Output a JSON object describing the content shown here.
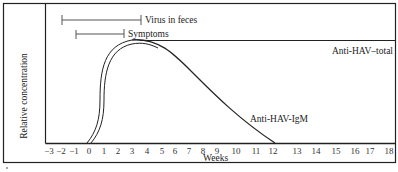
{
  "chart_data": {
    "type": "line",
    "title": "",
    "xlabel": "Weeks",
    "ylabel": "Relative concentration",
    "x_ticks": [
      "-3",
      "-2",
      "-1",
      "0",
      "1",
      "2",
      "3",
      "4",
      "5",
      "6",
      "7",
      "8",
      "9",
      "10",
      "11",
      "12",
      "13",
      "14",
      "15",
      "16",
      "17",
      "18"
    ],
    "xlim": [
      -3,
      18
    ],
    "grid": false,
    "legend": "none (inline labels)",
    "series": [
      {
        "name": "Anti-HAV-total",
        "x": [
          0,
          0.5,
          1,
          1.5,
          2,
          2.5,
          3,
          3.5,
          4,
          6,
          10,
          14,
          18
        ],
        "values": [
          0,
          0.15,
          0.55,
          0.85,
          0.96,
          0.99,
          1.0,
          1.0,
          1.0,
          1.0,
          1.0,
          1.0,
          1.0
        ],
        "style": "double line"
      },
      {
        "name": "Anti-HAV-IgM",
        "x": [
          0,
          0.5,
          1,
          1.5,
          2,
          2.5,
          3,
          3.5,
          4,
          5,
          6,
          7,
          8,
          9,
          10,
          11,
          12
        ],
        "values": [
          0,
          0.15,
          0.55,
          0.85,
          0.96,
          1.0,
          1.02,
          1.0,
          0.97,
          0.88,
          0.76,
          0.62,
          0.46,
          0.31,
          0.17,
          0.06,
          0.0
        ],
        "style": "single line"
      }
    ],
    "intervals": [
      {
        "name": "Virus in feces",
        "start": -2,
        "end": 3.5
      },
      {
        "name": "Symptoms",
        "start": -1,
        "end": 2.5
      }
    ],
    "annotations": [
      "Virus in feces",
      "Symptoms",
      "Anti-HAV-total",
      "Anti-HAV-IgM"
    ]
  },
  "labels": {
    "virus": "Virus in feces",
    "symptoms": "Symptoms",
    "total": "Anti-HAV–total",
    "igm": "Anti-HAV-IgM",
    "xlabel": "Weeks",
    "ylabel": "Relative concentration"
  },
  "ticks": [
    {
      "label": "−3",
      "x": 49
    },
    {
      "label": "−2",
      "x": 61
    },
    {
      "label": "−1",
      "x": 74
    },
    {
      "label": "0",
      "x": 89
    },
    {
      "label": "1",
      "x": 104
    },
    {
      "label": "2",
      "x": 118
    },
    {
      "label": "3",
      "x": 132
    },
    {
      "label": "4",
      "x": 147
    },
    {
      "label": "5",
      "x": 162
    },
    {
      "label": "6",
      "x": 175
    },
    {
      "label": "7",
      "x": 189
    },
    {
      "label": "8",
      "x": 203
    },
    {
      "label": "9",
      "x": 217
    },
    {
      "label": "10",
      "x": 236
    },
    {
      "label": "11",
      "x": 256
    },
    {
      "label": "12",
      "x": 273
    },
    {
      "label": "13",
      "x": 297
    },
    {
      "label": "14",
      "x": 316
    },
    {
      "label": "15",
      "x": 336
    },
    {
      "label": "16",
      "x": 355
    },
    {
      "label": "17",
      "x": 370
    },
    {
      "label": "18",
      "x": 389
    }
  ]
}
